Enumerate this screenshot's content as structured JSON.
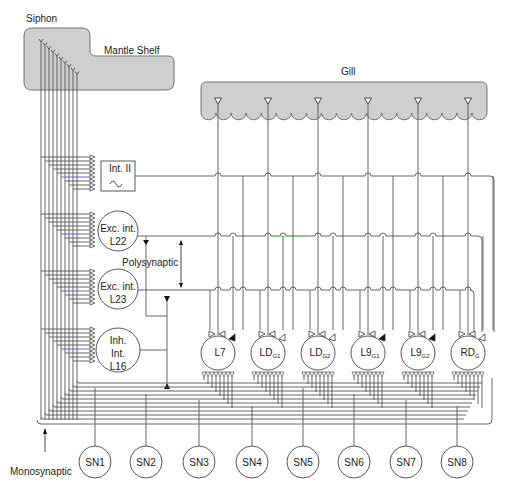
{
  "organs": {
    "siphon": "Siphon",
    "mantle_shelf": "Mantle Shelf",
    "gill": "Gill"
  },
  "interneurons": {
    "int_ii": "Int. II",
    "exc_l22_line1": "Exc. int.",
    "exc_l22_line2": "L22",
    "exc_l23_line1": "Exc. int.",
    "exc_l23_line2": "L23",
    "inh_l16_line1": "Inh.",
    "inh_l16_line2": "Int.",
    "inh_l16_line3": "L16"
  },
  "motor_neurons": [
    {
      "base": "L7",
      "sub": ""
    },
    {
      "base": "LD",
      "sub": "G1"
    },
    {
      "base": "LD",
      "sub": "G2"
    },
    {
      "base": "L9",
      "sub": "G1"
    },
    {
      "base": "L9",
      "sub": "G2"
    },
    {
      "base": "RD",
      "sub": "G"
    }
  ],
  "sensory_neurons": [
    "SN1",
    "SN2",
    "SN3",
    "SN4",
    "SN5",
    "SN6",
    "SN7",
    "SN8"
  ],
  "annotations": {
    "polysynaptic": "Polysynaptic",
    "monosynaptic": "Monosynaptic"
  },
  "colors": {
    "organ_fill": "#cfcfcf",
    "line": "#555555",
    "accent_green": "#6fd46f",
    "accent_red": "#cc4444",
    "accent_blue": "#5555cc"
  }
}
